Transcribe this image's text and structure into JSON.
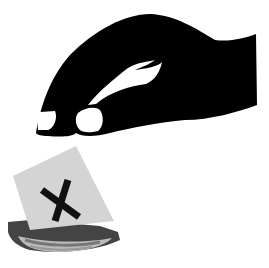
{
  "image": {
    "description": "Black silhouette hand dropping a ballot paper marked with an X into a ballot box slot",
    "colors": {
      "background": "#ffffff",
      "hand": "#000000",
      "nail": "#ffffff",
      "ballot": "#d4d4d4",
      "mark": "#111111",
      "box": "#3a3a3a"
    },
    "ballot_mark": "✕"
  }
}
